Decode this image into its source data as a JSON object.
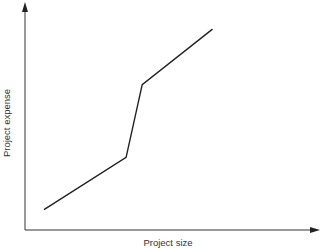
{
  "chart_data": {
    "type": "line",
    "title": "",
    "xlabel": "Project size",
    "ylabel": "Project expense",
    "xlim": [
      0,
      10
    ],
    "ylim": [
      0,
      10
    ],
    "grid": false,
    "legend": "none",
    "x_ticks": [],
    "y_ticks": [],
    "series": [
      {
        "name": "expense",
        "color": "#222222",
        "x": [
          0.65,
          3.45,
          4.0,
          6.4
        ],
        "y": [
          0.9,
          3.2,
          6.4,
          8.85
        ]
      }
    ]
  }
}
